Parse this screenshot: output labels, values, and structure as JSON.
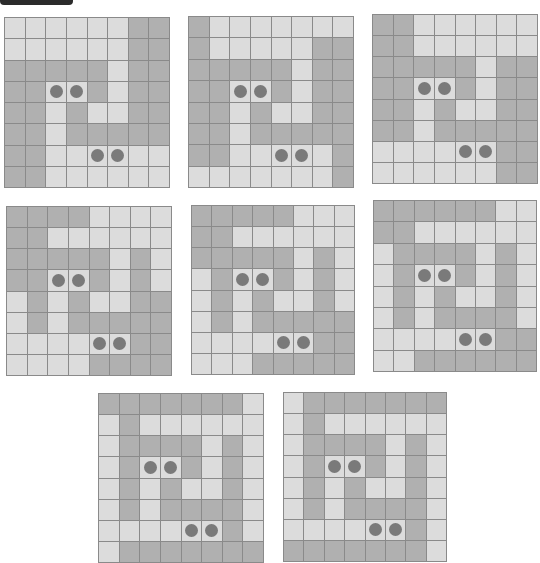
{
  "header": {
    "bar_color": "#2b2b2b"
  },
  "colors": {
    "light": "#dcdcdc",
    "dark": "#b0b0b0",
    "line": "#8a8a8a",
    "dot": "#7a7a7a"
  },
  "legend": {
    "L": "light cell",
    "D": "dark cell",
    "dot_marker": "circle"
  },
  "grids": [
    {
      "id": 1,
      "x": 4,
      "y": 17,
      "w": 166,
      "h": 171,
      "rows": [
        "LLLLLLDD",
        "LLLLLLDD",
        "DDDDDLDD",
        "DDLLDLDD",
        "DDLDLLDD",
        "DDLDDDDD",
        "DDLLLLLL",
        "DDLLLLLL"
      ],
      "dots": [
        [
          3,
          2
        ],
        [
          3,
          3
        ],
        [
          6,
          4
        ],
        [
          6,
          5
        ]
      ]
    },
    {
      "id": 2,
      "x": 188,
      "y": 16,
      "w": 166,
      "h": 172,
      "rows": [
        "DLLLLLLL",
        "DLLLLLDD",
        "DDDDDLDD",
        "DDLLDLDD",
        "DDLDLLDD",
        "DDLDDDDD",
        "DDLLLLLD",
        "LLLLLLLD"
      ],
      "dots": [
        [
          3,
          2
        ],
        [
          3,
          3
        ],
        [
          6,
          4
        ],
        [
          6,
          5
        ]
      ]
    },
    {
      "id": 3,
      "x": 372,
      "y": 14,
      "w": 166,
      "h": 170,
      "rows": [
        "DDLLLLLL",
        "DDLLLLLL",
        "DDDDDLDD",
        "DDLLDLDD",
        "DDLDLLDD",
        "DDLDDDDD",
        "LLLLLLDD",
        "LLLLLLDD"
      ],
      "dots": [
        [
          3,
          2
        ],
        [
          3,
          3
        ],
        [
          6,
          4
        ],
        [
          6,
          5
        ]
      ]
    },
    {
      "id": 4,
      "x": 6,
      "y": 206,
      "w": 166,
      "h": 170,
      "rows": [
        "DDDDLLLL",
        "DDLLLLLL",
        "DDDDDLDL",
        "DDLLDLDL",
        "LDLDLLDD",
        "LDLDDDDD",
        "LLLLLLDD",
        "LLLLDDDD"
      ],
      "dots": [
        [
          3,
          2
        ],
        [
          3,
          3
        ],
        [
          6,
          4
        ],
        [
          6,
          5
        ]
      ]
    },
    {
      "id": 5,
      "x": 191,
      "y": 205,
      "w": 164,
      "h": 170,
      "rows": [
        "DDDDDLLL",
        "DDLLLLLL",
        "DDDDDLDL",
        "LDLLDLDL",
        "LDLDLLDL",
        "LDLDDDDD",
        "LLLLLLDD",
        "LLLDDDDD"
      ],
      "dots": [
        [
          3,
          2
        ],
        [
          3,
          3
        ],
        [
          6,
          4
        ],
        [
          6,
          5
        ]
      ]
    },
    {
      "id": 6,
      "x": 373,
      "y": 200,
      "w": 164,
      "h": 172,
      "rows": [
        "DDDDDDLL",
        "DDLLLLLL",
        "LDDDDLDL",
        "LDLLDLDL",
        "LDLDLLDL",
        "LDLDDDDL",
        "LLLLLLDD",
        "LLDDDDDD"
      ],
      "dots": [
        [
          3,
          2
        ],
        [
          3,
          3
        ],
        [
          6,
          4
        ],
        [
          6,
          5
        ]
      ]
    },
    {
      "id": 7,
      "x": 98,
      "y": 393,
      "w": 166,
      "h": 170,
      "rows": [
        "DDDDDDDL",
        "LDLLLLLL",
        "LDDDDLDL",
        "LDLLDLDL",
        "LDLDLLDL",
        "LDLDDDDL",
        "LLLLLLDL",
        "LDDDDDDD"
      ],
      "dots": [
        [
          3,
          2
        ],
        [
          3,
          3
        ],
        [
          6,
          4
        ],
        [
          6,
          5
        ]
      ]
    },
    {
      "id": 8,
      "x": 283,
      "y": 392,
      "w": 164,
      "h": 170,
      "rows": [
        "LDDDDDDD",
        "LDLLLLLL",
        "LDDDDLDL",
        "LDLLDLDL",
        "LDLDLLDL",
        "LDLDDDDL",
        "LLLLLLDL",
        "DDDDDDDL"
      ],
      "dots": [
        [
          3,
          2
        ],
        [
          3,
          3
        ],
        [
          6,
          4
        ],
        [
          6,
          5
        ]
      ]
    }
  ]
}
